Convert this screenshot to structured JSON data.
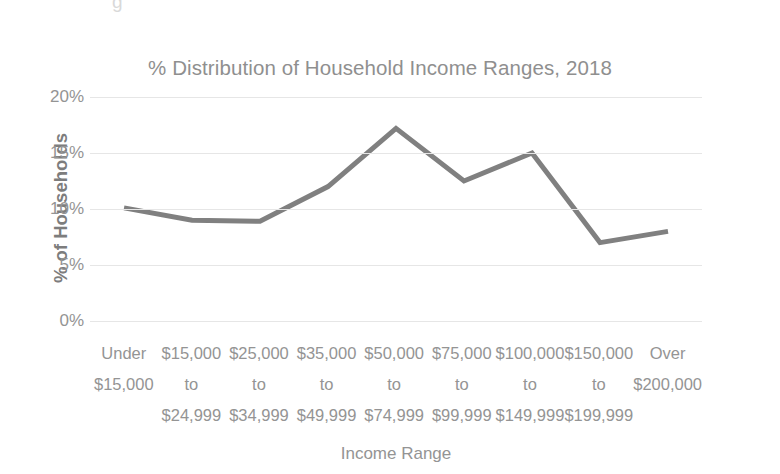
{
  "ghost_text": "g",
  "chart_data": {
    "type": "line",
    "title": "% Distribution of Household Income Ranges, 2018",
    "xlabel": "Income Range",
    "ylabel": "% of Households",
    "categories": [
      "Under\n$15,000",
      "$15,000\nto\n$24,999",
      "$25,000\nto\n$34,999",
      "$35,000\nto\n$49,999",
      "$50,000\nto\n$74,999",
      "$75,000\nto\n$99,999",
      "$100,000\nto\n$149,999",
      "$150,000\nto\n$199,999",
      "Over\n$200,000"
    ],
    "category_lines": [
      [
        "Under",
        "$15,000",
        ""
      ],
      [
        "$15,000",
        "to",
        "$24,999"
      ],
      [
        "$25,000",
        "to",
        "$34,999"
      ],
      [
        "$35,000",
        "to",
        "$49,999"
      ],
      [
        "$50,000",
        "to",
        "$74,999"
      ],
      [
        "$75,000",
        "to",
        "$99,999"
      ],
      [
        "$100,000",
        "to",
        "$149,999"
      ],
      [
        "$150,000",
        "to",
        "$199,999"
      ],
      [
        "Over",
        "$200,000",
        ""
      ]
    ],
    "values": [
      10.1,
      9.0,
      8.9,
      12.0,
      17.2,
      12.5,
      15.0,
      7.0,
      8.0
    ],
    "ylim": [
      0,
      20
    ],
    "ytick_values": [
      20,
      15,
      10,
      5,
      0
    ],
    "ytick_labels": [
      "20%",
      "15%",
      "10%",
      "5%",
      "0%"
    ],
    "grid": true,
    "legend": false,
    "series_color": "#808080",
    "gridline_color": "#e6e6e6",
    "text_color": "#949494",
    "line_width": 5
  }
}
